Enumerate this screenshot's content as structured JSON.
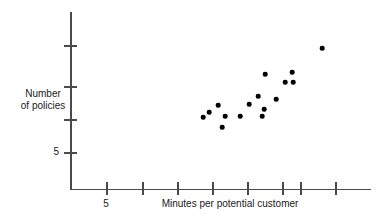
{
  "chart_data": {
    "type": "scatter",
    "title": "",
    "xlabel": "Minutes per potential customer",
    "ylabel": "Number of policies",
    "grid": false,
    "legend": null,
    "x_tick_labels": [
      "5"
    ],
    "y_tick_labels": [
      "5"
    ],
    "x_axis": {
      "labeled_ticks": [
        5
      ],
      "tick_count": 8,
      "tick_spacing_units": 1,
      "range_units": [
        2.5,
        11.0
      ]
    },
    "y_axis": {
      "labeled_ticks": [
        5
      ],
      "tick_count": 4,
      "tick_spacing_units": 5,
      "range_units": [
        0,
        22
      ]
    },
    "points": [
      {
        "x": 5.95,
        "y": 11.5
      },
      {
        "x": 6.35,
        "y": 13.0
      },
      {
        "x": 6.45,
        "y": 10.0
      },
      {
        "x": 6.75,
        "y": 11.6
      },
      {
        "x": 7.15,
        "y": 11.6
      },
      {
        "x": 7.55,
        "y": 13.2
      },
      {
        "x": 7.85,
        "y": 14.2
      },
      {
        "x": 7.95,
        "y": 11.6
      },
      {
        "x": 8.05,
        "y": 16.9
      },
      {
        "x": 8.15,
        "y": 12.6
      },
      {
        "x": 8.55,
        "y": 13.9
      },
      {
        "x": 9.15,
        "y": 15.9
      },
      {
        "x": 9.45,
        "y": 16.9
      },
      {
        "x": 9.45,
        "y": 15.9
      },
      {
        "x": 10.4,
        "y": 19.4
      },
      {
        "x": 6.15,
        "y": 12.2
      }
    ],
    "point_pixels": [
      {
        "x": 203,
        "y": 117
      },
      {
        "x": 218,
        "y": 105
      },
      {
        "x": 222,
        "y": 127
      },
      {
        "x": 225,
        "y": 116
      },
      {
        "x": 240,
        "y": 116
      },
      {
        "x": 249,
        "y": 104
      },
      {
        "x": 258,
        "y": 96
      },
      {
        "x": 262,
        "y": 116
      },
      {
        "x": 265,
        "y": 74
      },
      {
        "x": 264,
        "y": 109
      },
      {
        "x": 276,
        "y": 99
      },
      {
        "x": 285,
        "y": 82
      },
      {
        "x": 292,
        "y": 72
      },
      {
        "x": 293,
        "y": 82
      },
      {
        "x": 322,
        "y": 48
      },
      {
        "x": 209,
        "y": 112
      }
    ]
  },
  "axis": {
    "y_label_line1": "Number",
    "y_label_line2": "of policies",
    "x_label": "Minutes per potential customer",
    "y_tick_5": "5",
    "x_tick_5": "5"
  },
  "colors": {
    "point": "#000000",
    "axis": "#4a4a4a",
    "text": "#1a1a1a",
    "background": "#ffffff"
  }
}
